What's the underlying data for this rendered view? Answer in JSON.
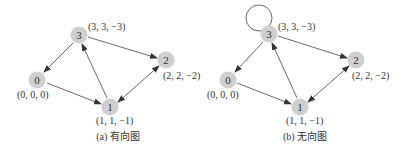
{
  "graphs": [
    {
      "caption": "(a) 有向图",
      "nodes": [
        {
          "id": "0",
          "label": "0",
          "coord": "(0, 0, 0)"
        },
        {
          "id": "1",
          "label": "1",
          "coord": "(1, 1, −1)"
        },
        {
          "id": "2",
          "label": "2",
          "coord": "(2, 2, −2)"
        },
        {
          "id": "3",
          "label": "3",
          "coord": "(3, 3, −3)"
        }
      ],
      "edges": [
        {
          "from": "3",
          "to": "0",
          "arrow": "end"
        },
        {
          "from": "0",
          "to": "1",
          "arrow": "end"
        },
        {
          "from": "1",
          "to": "3",
          "arrow": "end"
        },
        {
          "from": "3",
          "to": "2",
          "arrow": "end"
        },
        {
          "from": "1",
          "to": "2",
          "arrow": "both"
        }
      ]
    },
    {
      "caption": "(b) 无向图",
      "nodes": [
        {
          "id": "0",
          "label": "0",
          "coord": "(0, 0, 0)"
        },
        {
          "id": "1",
          "label": "1",
          "coord": "(1, 1, −1)"
        },
        {
          "id": "2",
          "label": "2",
          "coord": "(2, 2, −2)"
        },
        {
          "id": "3",
          "label": "3",
          "coord": "(3, 3, −3)"
        }
      ],
      "edges": [
        {
          "from": "3",
          "to": "0",
          "arrow": "end"
        },
        {
          "from": "0",
          "to": "1",
          "arrow": "end"
        },
        {
          "from": "1",
          "to": "3",
          "arrow": "end"
        },
        {
          "from": "3",
          "to": "2",
          "arrow": "end"
        },
        {
          "from": "1",
          "to": "2",
          "arrow": "both"
        },
        {
          "from": "3",
          "to": "3",
          "arrow": "none",
          "type": "self-loop"
        }
      ]
    }
  ]
}
